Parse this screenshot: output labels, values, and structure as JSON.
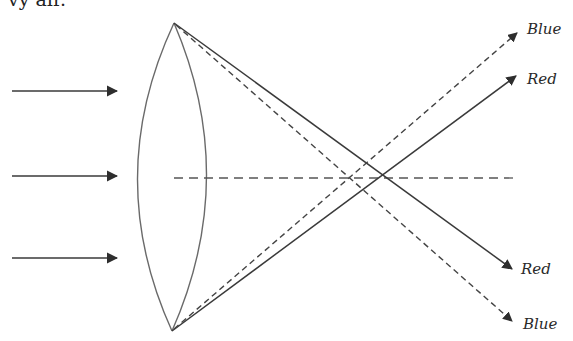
{
  "caption_fragment": "vy  air.",
  "diagram": {
    "incident_rays": 3,
    "labels": {
      "blue_top": "Blue",
      "red_top": "Red",
      "red_bottom": "Red",
      "blue_bottom": "Blue"
    },
    "colors": {
      "line": "#3a3a3a",
      "lens": "#6a6a6a",
      "background": "#ffffff"
    },
    "geometry": {
      "lens_top": [
        174,
        23
      ],
      "lens_bottom": [
        172,
        331
      ],
      "lens_left_x": 138,
      "lens_right_x": 206,
      "optical_axis_y": 178,
      "blue_focus": [
        351,
        178
      ],
      "red_focus": [
        383,
        178
      ],
      "incident_ray_y": [
        91,
        176,
        258
      ]
    }
  }
}
